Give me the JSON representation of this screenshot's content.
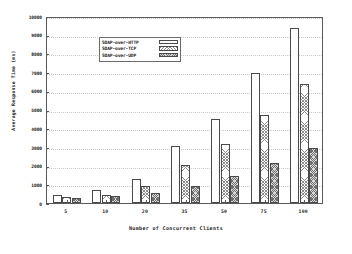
{
  "chart_data": {
    "type": "bar",
    "title": "",
    "xlabel": "Number of Concurrent Clients",
    "ylabel": "Average Response Time (ms)",
    "categories": [
      "5",
      "10",
      "20",
      "35",
      "50",
      "75",
      "100"
    ],
    "series": [
      {
        "name": "SOAP-over-HTTP",
        "values": [
          430,
          690,
          1270,
          3040,
          4490,
          6950,
          9370
        ]
      },
      {
        "name": "SOAP-over-TCP",
        "values": [
          300,
          430,
          890,
          2020,
          3130,
          4730,
          6370
        ]
      },
      {
        "name": "SOAP-over-UDP",
        "values": [
          255,
          360,
          540,
          900,
          1420,
          2140,
          2950
        ]
      }
    ],
    "ylim": [
      0,
      10000
    ],
    "ytick_labels": [
      "0",
      "1000",
      "2000",
      "3000",
      "4000",
      "5000",
      "6000",
      "7000",
      "8000",
      "9000",
      "10000"
    ],
    "ytick_values": [
      0,
      1000,
      2000,
      3000,
      4000,
      5000,
      6000,
      7000,
      8000,
      9000,
      10000
    ],
    "grid": true,
    "legend_position": "top-left",
    "colors": {
      "series_0": "#ffffff",
      "series_1": "#b0b0b0",
      "series_2": "#808080",
      "axis": "#5a5a5a",
      "grid": "#c9c9c9",
      "text": "#1a1a1a"
    }
  }
}
